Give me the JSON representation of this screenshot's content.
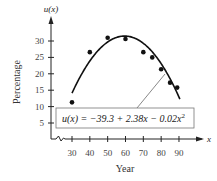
{
  "chart_data": {
    "type": "scatter",
    "title": "",
    "xlabel": "Year",
    "ylabel": "Percentage",
    "y_axis_function_label": "u(x)",
    "x_axis_variable_label": "x",
    "x_ticks": [
      30,
      40,
      50,
      60,
      70,
      80,
      90
    ],
    "y_ticks": [
      5,
      10,
      15,
      20,
      25,
      30
    ],
    "xlim": [
      30,
      90
    ],
    "ylim": [
      0,
      30
    ],
    "axis_break_on_x": true,
    "grid": false,
    "legend": null,
    "series": [
      {
        "name": "data",
        "type": "scatter",
        "x": [
          30,
          40,
          50,
          60,
          70,
          75,
          80,
          85,
          89
        ],
        "y": [
          11.3,
          26.6,
          31.0,
          30.6,
          26.6,
          25.0,
          21.4,
          17.3,
          15.8
        ]
      },
      {
        "name": "fit",
        "type": "line",
        "equation": "u(x) = −39.3 + 2.38x − 0.02x²",
        "coefficients": {
          "c0": -39.3,
          "c1": 2.38,
          "c2": -0.02
        },
        "x_range": [
          30,
          90.5
        ]
      }
    ],
    "annotations": [
      {
        "text": "u(x) = −39.3 + 2.38x − 0.02x²",
        "boxed": true,
        "points_to_x": 83
      }
    ]
  },
  "labels": {
    "y_function": "u(x)",
    "x_variable": "x",
    "y_axis_title": "Percentage",
    "x_axis_title": "Year",
    "equation_prefix": "u(x) = −39.3 + 2.38x − 0.02x",
    "equation_exponent": "2"
  }
}
